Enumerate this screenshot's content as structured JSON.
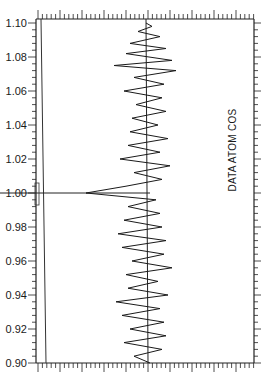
{
  "chart_data": {
    "type": "line",
    "orientation": "vertical-trace",
    "title": "DATA ATOM COS",
    "xlabel": "",
    "ylabel": "",
    "ylim": [
      0.9,
      1.1
    ],
    "y_ticks": [
      "1.10",
      "1.08",
      "1.06",
      "1.04",
      "1.02",
      "1.00",
      "0.98",
      "0.96",
      "0.94",
      "0.92",
      "0.90"
    ],
    "grid": false,
    "center_line": true,
    "reference_line_y": 1.0,
    "annotations": [
      "DATA ATOM COS"
    ],
    "trace_description": "Oscillating trace about a vertical center line; the largest leftward excursion occurs at y = 1.00",
    "series": [
      {
        "name": "trace",
        "y": [
          1.1,
          1.098,
          1.095,
          1.092,
          1.088,
          1.085,
          1.082,
          1.078,
          1.075,
          1.072,
          1.068,
          1.064,
          1.06,
          1.056,
          1.052,
          1.048,
          1.044,
          1.04,
          1.036,
          1.032,
          1.028,
          1.024,
          1.02,
          1.016,
          1.012,
          1.008,
          1.004,
          1.0,
          0.996,
          0.992,
          0.988,
          0.984,
          0.98,
          0.976,
          0.972,
          0.968,
          0.964,
          0.96,
          0.956,
          0.952,
          0.948,
          0.944,
          0.94,
          0.936,
          0.932,
          0.928,
          0.924,
          0.92,
          0.916,
          0.912,
          0.908,
          0.904,
          0.9
        ],
        "x_offset": [
          0,
          6,
          -8,
          14,
          -16,
          20,
          -20,
          26,
          -32,
          30,
          -12,
          18,
          -22,
          16,
          -10,
          20,
          -14,
          12,
          -16,
          22,
          -18,
          14,
          -26,
          24,
          -12,
          16,
          -20,
          -60,
          10,
          -18,
          14,
          -22,
          16,
          -28,
          20,
          -24,
          18,
          -14,
          26,
          -20,
          12,
          -18,
          22,
          -30,
          14,
          -24,
          18,
          -16,
          20,
          -22,
          16,
          -12,
          4
        ]
      }
    ]
  }
}
